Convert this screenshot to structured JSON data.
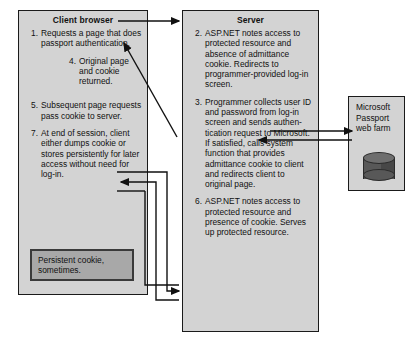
{
  "diagram": {
    "background_color": "#ffffff",
    "panel_fill": "#d3d3d3",
    "panel_border": "#1a1a1a",
    "callout_fill": "#a8a8a8",
    "cylinder_color": "#585858"
  },
  "client": {
    "title": "Client browser",
    "steps": [
      {
        "number": "1.",
        "text": "Requests a page that does passport authentication.",
        "indented": false
      },
      {
        "number": "4.",
        "text": "Original page and cookie returned.",
        "indented": true
      },
      {
        "number": "5.",
        "text": "Subsequent page requests pass cookie to server.",
        "indented": false
      },
      {
        "number": "7.",
        "text": "At end of session, client either dumps cookie or stores persistently for later access without need for log-in.",
        "indented": false
      }
    ],
    "callout": {
      "text": "Persistent cookie, sometimes."
    }
  },
  "server": {
    "title": "Server",
    "steps": [
      {
        "number": "2.",
        "text": "ASP.NET notes access to protected resource and absence of admittance cookie. Redirects to programmer-provided log-in screen.",
        "indented": false
      },
      {
        "number": "3.",
        "text": "Programmer collects user ID and password from log-in screen and sends authen-tication request to Microsoft. If satisfied, calls system function that provides admittance cookie to client and redirects client to original page.",
        "indented": false
      },
      {
        "number": "6.",
        "text": "ASP.NET notes access to protected resource and presence of cookie. Serves up protected resource.",
        "indented": false
      }
    ]
  },
  "passport": {
    "title_lines": "Microsoft Passport web farm",
    "icon": "database-cylinder-icon"
  },
  "arrows": [
    {
      "name": "client-to-server-request",
      "direction": "right"
    },
    {
      "name": "server-to-client-original-page",
      "direction": "up-left-diagonal"
    },
    {
      "name": "client-cookie-to-server",
      "direction": "right-then-down"
    },
    {
      "name": "server-response-to-client",
      "direction": "left"
    },
    {
      "name": "server-to-passport-auth-request",
      "direction": "right"
    },
    {
      "name": "passport-to-server-auth-reply",
      "direction": "left"
    }
  ]
}
